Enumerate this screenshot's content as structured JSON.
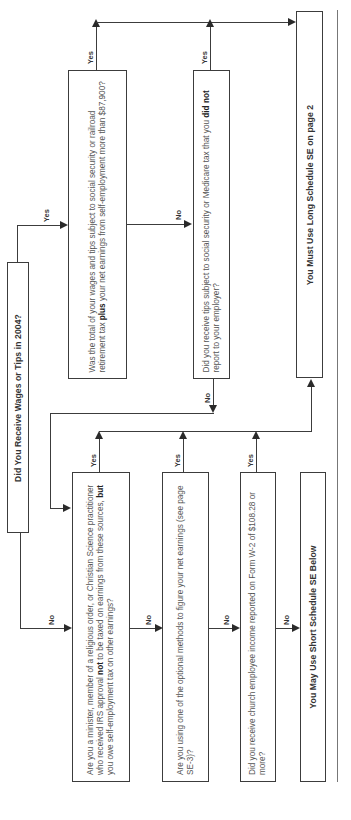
{
  "flowchart": {
    "start": {
      "label": "Did You Receive Wages or Tips in 2004?"
    },
    "q_total_wages": {
      "pre": "Was the total of your wages and tips subject to social security or railroad retirement tax ",
      "bold": "plus",
      "post": " your net earnings from self-employment more than $87,900?"
    },
    "q_unreported_tips": {
      "pre": "Did you receive tips subject to social security or Medicare tax that you ",
      "bold": "did not",
      "post": " report to your employer?"
    },
    "q_minister": {
      "pre": "Are you a minister, member of a religious order, or Christian Science practitioner who received IRS approval ",
      "bold1": "not",
      "mid": " to be taxed on earnings from these sources, ",
      "bold2": "but",
      "post": " you owe self-employment tax on other earnings?"
    },
    "q_optional": {
      "text": "Are you using one of the optional methods to figure your net earnings (see page SE-3)?"
    },
    "q_church": {
      "text": "Did you receive church employee income reported on Form W-2 of $108.28 or more?"
    },
    "result_long": {
      "label": "You Must Use Long Schedule SE on page 2"
    },
    "result_short": {
      "label": "You May Use Short Schedule SE Below"
    },
    "labels": {
      "yes": "Yes",
      "no": "No"
    }
  }
}
